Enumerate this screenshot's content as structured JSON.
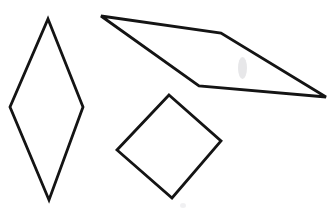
{
  "figure": {
    "title": "Three quadrilaterals outline figure",
    "background_color": "#ffffff",
    "stroke_color": "#141414",
    "width": 334,
    "height": 221
  },
  "shapes": [
    {
      "id": "rhombus",
      "label": "Tall rhombus",
      "type": "polygon",
      "sides": 4,
      "stroke_color": "#141414",
      "stroke_width": 2.8,
      "fill": "none",
      "points": "48,19 83,107 49,200 10,107",
      "vertices": [
        {
          "name": "top",
          "x": 48,
          "y": 19
        },
        {
          "name": "right",
          "x": 83,
          "y": 107
        },
        {
          "name": "bottom",
          "x": 49,
          "y": 200
        },
        {
          "name": "left",
          "x": 10,
          "y": 107
        }
      ]
    },
    {
      "id": "parallelogram",
      "label": "Wide parallelogram",
      "type": "polygon",
      "sides": 4,
      "stroke_color": "#141414",
      "stroke_width": 2.8,
      "fill": "none",
      "points": "101,16 221,33 326,97 199,86",
      "vertices": [
        {
          "name": "top-left",
          "x": 101,
          "y": 16
        },
        {
          "name": "top-right",
          "x": 221,
          "y": 33
        },
        {
          "name": "bottom-right",
          "x": 326,
          "y": 97
        },
        {
          "name": "bottom-left",
          "x": 199,
          "y": 86
        }
      ]
    },
    {
      "id": "square-diamond",
      "label": "Square rotated forty-five degrees",
      "type": "polygon",
      "sides": 4,
      "stroke_color": "#141414",
      "stroke_width": 2.8,
      "fill": "none",
      "points": "169,95 221,141 172,198 117,150",
      "vertices": [
        {
          "name": "top",
          "x": 169,
          "y": 95
        },
        {
          "name": "right",
          "x": 221,
          "y": 141
        },
        {
          "name": "bottom",
          "x": 172,
          "y": 198
        },
        {
          "name": "left",
          "x": 117,
          "y": 150
        }
      ]
    }
  ],
  "artifacts": [
    {
      "id": "smudge-parallelogram",
      "label": "Faint scan smudge inside parallelogram",
      "color": "#cfcfd4",
      "x": 238,
      "y": 57,
      "width": 9,
      "height": 22
    },
    {
      "id": "smudge-diamond",
      "label": "Faint scan smudge below diamond",
      "color": "#dedee2",
      "x": 180,
      "y": 203,
      "width": 6,
      "height": 5
    }
  ]
}
